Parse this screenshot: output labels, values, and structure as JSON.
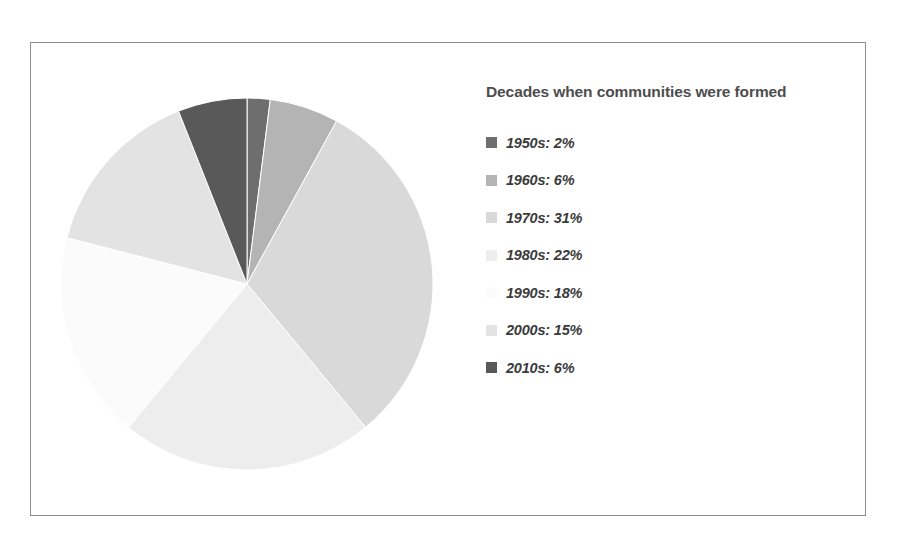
{
  "figure": {
    "background_color": "#ffffff",
    "frame_color": "#8d8d8d"
  },
  "legend": {
    "title": "Decades when communities were formed",
    "title_color": "#4d4d4d",
    "label_color": "#3b3b3b"
  },
  "chart_data": {
    "type": "pie",
    "title": "Decades when communities were formed",
    "xlabel": "",
    "ylabel": "",
    "legend_position": "right",
    "grid": false,
    "start_angle_deg": 0,
    "direction": "clockwise",
    "units": "percent",
    "categories": [
      "1950s",
      "1960s",
      "1970s",
      "1980s",
      "1990s",
      "2000s",
      "2010s"
    ],
    "values": [
      2,
      6,
      31,
      22,
      18,
      15,
      6
    ],
    "labels": [
      "1950s: 2%",
      "1960s: 6%",
      "1970s: 31%",
      "1980s: 22%",
      "1990s: 18%",
      "2000s: 15%",
      "2010s: 6%"
    ],
    "colors": [
      "#6e6e6e",
      "#b4b4b4",
      "#d9d9d9",
      "#ededed",
      "#fbfbfb",
      "#e3e3e3",
      "#595959"
    ],
    "slice_edge_color": "#ffffff"
  },
  "pie_geometry": {
    "center_x": 188,
    "center_y": 188,
    "radius": 186
  }
}
